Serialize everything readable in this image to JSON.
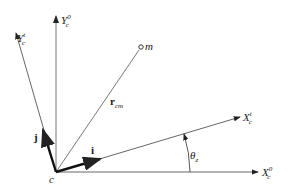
{
  "diagram": {
    "origin": {
      "label": "c",
      "x": 56,
      "y": 172
    },
    "axes": [
      {
        "id": "X0",
        "base": "X",
        "sub": "c",
        "sup": "0",
        "end": [
          258,
          172
        ]
      },
      {
        "id": "Y0",
        "base": "Y",
        "sub": "c",
        "sup": "0",
        "end": [
          56,
          16
        ]
      },
      {
        "id": "Xt",
        "base": "X",
        "sub": "c",
        "sup": "t",
        "end": [
          240,
          117
        ]
      },
      {
        "id": "Yt",
        "base": "Y",
        "sub": "c",
        "sup": "t",
        "end": [
          16,
          33
        ]
      }
    ],
    "point_m": {
      "label": "m",
      "x": 141,
      "y": 48
    },
    "vector_r": {
      "base": "r",
      "sub": "cm"
    },
    "unit_i": {
      "label": "i"
    },
    "unit_j": {
      "label": "j"
    },
    "angle": {
      "base": "θ",
      "sub": "z"
    },
    "colors": {
      "line": "#444444",
      "thick": "#111111",
      "text": "#1a1a1a"
    }
  }
}
